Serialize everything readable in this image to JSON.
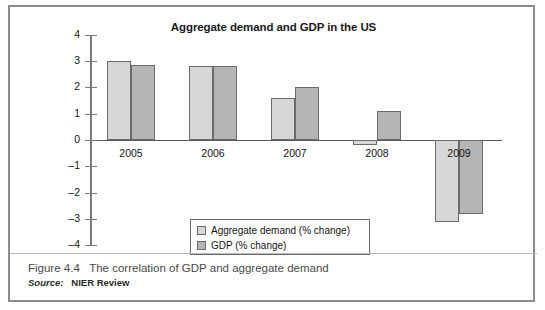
{
  "figure": {
    "caption_label": "Figure 4.4",
    "caption_text": "The correlation of GDP and aggregate demand",
    "source_label": "Source:",
    "source_value": "NIER Review"
  },
  "colors": {
    "aggregate_demand": "#d7d7d7",
    "gdp": "#b5b5b5",
    "bar_outline": "#6b6b6b",
    "frame": "#8c8c8c",
    "axis": "#7a7a7a"
  },
  "chart_data": {
    "type": "bar",
    "title": "Aggregate demand and GDP in the US",
    "xlabel": "",
    "ylabel": "",
    "ylim": [
      -4,
      4
    ],
    "yticks": [
      4,
      3,
      2,
      1,
      0,
      "-1",
      "-2",
      "-3",
      "-4"
    ],
    "ytick_values": [
      4,
      3,
      2,
      1,
      0,
      -1,
      -2,
      -3,
      -4
    ],
    "grid": false,
    "legend_position": "inside-bottom-center",
    "categories": [
      "2005",
      "2006",
      "2007",
      "2008",
      "2009"
    ],
    "series": [
      {
        "name": "Aggregate demand (% change)",
        "color": "#d7d7d7",
        "values": [
          3.0,
          2.8,
          1.6,
          -0.2,
          -3.1
        ]
      },
      {
        "name": "GDP (% change)",
        "color": "#b5b5b5",
        "values": [
          2.87,
          2.8,
          2.0,
          1.1,
          -2.8
        ]
      }
    ]
  }
}
